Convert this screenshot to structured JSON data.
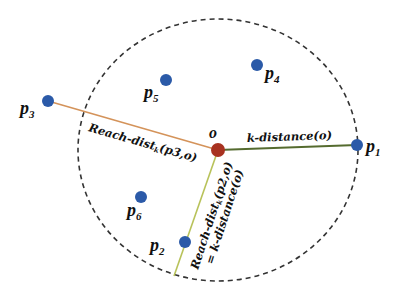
{
  "diagram": {
    "colors": {
      "boundary": "#333333",
      "point": "#2b5aa8",
      "center": "#a83220",
      "line_p3": "#d4935a",
      "line_p1": "#556b2f",
      "line_p2": "#b8c25a"
    },
    "center": {
      "label": "o"
    },
    "points": [
      {
        "id": "p1",
        "name": "p",
        "sub": "1"
      },
      {
        "id": "p2",
        "name": "p",
        "sub": "2"
      },
      {
        "id": "p3",
        "name": "p",
        "sub": "3"
      },
      {
        "id": "p4",
        "name": "p",
        "sub": "4"
      },
      {
        "id": "p5",
        "name": "p",
        "sub": "5"
      },
      {
        "id": "p6",
        "name": "p",
        "sub": "6"
      }
    ],
    "edges": {
      "o_p1": {
        "label": "k-distance(o)"
      },
      "o_p3": {
        "label_main": "Reach-dist",
        "label_sub": "k",
        "label_args": "(p3,o)"
      },
      "o_p2": {
        "label_main": "Reach-dist",
        "label_sub": "k",
        "label_args": "(p2,o)",
        "label_line2": "= k-distance(o)"
      }
    }
  }
}
